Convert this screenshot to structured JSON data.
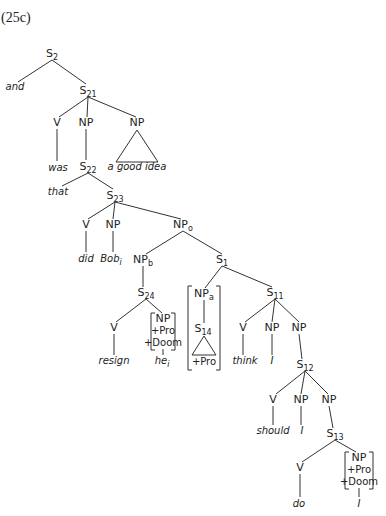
{
  "example_label": "(25c)",
  "nodes": [
    {
      "id": "S2",
      "cat": "S",
      "sub": "2",
      "x": 52,
      "y": 57,
      "type": "cat"
    },
    {
      "id": "and",
      "text": "and",
      "x": 15,
      "y": 90,
      "type": "word"
    },
    {
      "id": "S21",
      "cat": "S",
      "sub": "21",
      "x": 88,
      "y": 94,
      "type": "cat"
    },
    {
      "id": "V1",
      "cat": "V",
      "sub": "",
      "x": 57,
      "y": 126,
      "type": "cat"
    },
    {
      "id": "NP1",
      "cat": "NP",
      "sub": "",
      "x": 86,
      "y": 126,
      "type": "cat"
    },
    {
      "id": "NP2",
      "cat": "NP",
      "sub": "",
      "x": 137,
      "y": 126,
      "type": "cat"
    },
    {
      "id": "was",
      "text": "was",
      "x": 58,
      "y": 171,
      "type": "word"
    },
    {
      "id": "S22",
      "cat": "S",
      "sub": "22",
      "x": 88,
      "y": 170,
      "type": "cat"
    },
    {
      "id": "agoodidea",
      "text": "a good idea",
      "x": 137,
      "y": 170,
      "type": "word"
    },
    {
      "id": "that",
      "text": "that",
      "x": 58,
      "y": 195,
      "type": "word"
    },
    {
      "id": "S23",
      "cat": "S",
      "sub": "23",
      "x": 115,
      "y": 199,
      "type": "cat"
    },
    {
      "id": "V2",
      "cat": "V",
      "sub": "",
      "x": 86,
      "y": 228,
      "type": "cat"
    },
    {
      "id": "NP3",
      "cat": "NP",
      "sub": "",
      "x": 113,
      "y": 228,
      "type": "cat"
    },
    {
      "id": "NPo",
      "cat": "NP",
      "sub": "o",
      "x": 183,
      "y": 228,
      "type": "cat"
    },
    {
      "id": "did",
      "text": "did",
      "x": 86,
      "y": 262,
      "type": "word"
    },
    {
      "id": "Bob",
      "text": "Bob",
      "sub": "i",
      "x": 111,
      "y": 262,
      "type": "word"
    },
    {
      "id": "NPb",
      "cat": "NP",
      "sub": "b",
      "x": 143,
      "y": 263,
      "type": "cat"
    },
    {
      "id": "S1",
      "cat": "S",
      "sub": "1",
      "x": 222,
      "y": 263,
      "type": "cat"
    },
    {
      "id": "S24",
      "cat": "S",
      "sub": "24",
      "x": 146,
      "y": 296,
      "type": "cat"
    },
    {
      "id": "NPa",
      "cat": "NP",
      "sub": "a",
      "x": 204,
      "y": 297,
      "type": "cat"
    },
    {
      "id": "S11",
      "cat": "S",
      "sub": "11",
      "x": 275,
      "y": 296,
      "type": "cat"
    },
    {
      "id": "V3",
      "cat": "V",
      "sub": "",
      "x": 114,
      "y": 331,
      "type": "cat"
    },
    {
      "id": "NPpd1",
      "cat": "NP",
      "sub": "",
      "x": 163,
      "y": 322,
      "type": "cat"
    },
    {
      "id": "S14",
      "cat": "S",
      "sub": "14",
      "x": 203,
      "y": 332,
      "type": "cat"
    },
    {
      "id": "V4",
      "cat": "V",
      "sub": "",
      "x": 243,
      "y": 331,
      "type": "cat"
    },
    {
      "id": "NP5",
      "cat": "NP",
      "sub": "",
      "x": 272,
      "y": 331,
      "type": "cat"
    },
    {
      "id": "NP6",
      "cat": "NP",
      "sub": "",
      "x": 299,
      "y": 331,
      "type": "cat"
    },
    {
      "id": "resign",
      "text": "resign",
      "x": 114,
      "y": 364,
      "type": "word"
    },
    {
      "id": "he",
      "text": "he",
      "sub": "i",
      "x": 162,
      "y": 364,
      "type": "word"
    },
    {
      "id": "think",
      "text": "think",
      "x": 245,
      "y": 364,
      "type": "word"
    },
    {
      "id": "I1",
      "text": "I",
      "x": 272,
      "y": 364,
      "type": "word"
    },
    {
      "id": "S12",
      "cat": "S",
      "sub": "12",
      "x": 305,
      "y": 368,
      "type": "cat"
    },
    {
      "id": "V5",
      "cat": "V",
      "sub": "",
      "x": 273,
      "y": 403,
      "type": "cat"
    },
    {
      "id": "NP7",
      "cat": "NP",
      "sub": "",
      "x": 301,
      "y": 403,
      "type": "cat"
    },
    {
      "id": "NP8",
      "cat": "NP",
      "sub": "",
      "x": 329,
      "y": 403,
      "type": "cat"
    },
    {
      "id": "should",
      "text": "should",
      "x": 273,
      "y": 434,
      "type": "word"
    },
    {
      "id": "I2",
      "text": "I",
      "x": 302,
      "y": 434,
      "type": "word"
    },
    {
      "id": "S13",
      "cat": "S",
      "sub": "13",
      "x": 335,
      "y": 437,
      "type": "cat"
    },
    {
      "id": "V6",
      "cat": "V",
      "sub": "",
      "x": 300,
      "y": 471,
      "type": "cat"
    },
    {
      "id": "NPpd2",
      "cat": "NP",
      "sub": "",
      "x": 359,
      "y": 461,
      "type": "cat"
    },
    {
      "id": "do",
      "text": "do",
      "x": 299,
      "y": 507,
      "type": "word"
    },
    {
      "id": "I3",
      "text": "I",
      "x": 359,
      "y": 507,
      "type": "word"
    }
  ],
  "features": [
    {
      "id": "pd1_pro",
      "text": "+Pro",
      "x": 163,
      "y": 334
    },
    {
      "id": "pd1_doom",
      "text": "+Doom",
      "x": 163,
      "y": 346
    },
    {
      "id": "s14_pro",
      "text": "+Pro",
      "x": 204,
      "y": 365
    },
    {
      "id": "pd2_pro",
      "text": "+Pro",
      "x": 359,
      "y": 473
    },
    {
      "id": "pd2_doom",
      "text": "+Doom",
      "x": 359,
      "y": 485
    }
  ],
  "edges": [
    [
      52,
      60,
      18,
      82
    ],
    [
      52,
      60,
      86,
      84
    ],
    [
      88,
      97,
      59,
      117
    ],
    [
      88,
      97,
      87,
      117
    ],
    [
      88,
      97,
      136,
      117
    ],
    [
      57,
      129,
      57,
      161
    ],
    [
      86,
      129,
      86,
      160
    ],
    [
      88,
      173,
      62,
      186
    ],
    [
      88,
      173,
      113,
      189
    ],
    [
      115,
      202,
      88,
      219
    ],
    [
      115,
      202,
      113,
      219
    ],
    [
      115,
      202,
      181,
      219
    ],
    [
      86,
      231,
      86,
      252
    ],
    [
      113,
      231,
      113,
      252
    ],
    [
      183,
      231,
      146,
      254
    ],
    [
      183,
      231,
      222,
      254
    ],
    [
      143,
      266,
      143,
      287
    ],
    [
      146,
      299,
      116,
      322
    ],
    [
      146,
      299,
      162,
      313
    ],
    [
      222,
      266,
      205,
      288
    ],
    [
      222,
      266,
      272,
      287
    ],
    [
      275,
      299,
      245,
      322
    ],
    [
      275,
      299,
      272,
      322
    ],
    [
      275,
      299,
      299,
      322
    ],
    [
      114,
      334,
      114,
      355
    ],
    [
      163,
      349,
      163,
      355
    ],
    [
      204,
      300,
      204,
      323
    ],
    [
      243,
      334,
      243,
      355
    ],
    [
      272,
      334,
      272,
      355
    ],
    [
      299,
      334,
      302,
      359
    ],
    [
      305,
      371,
      276,
      394
    ],
    [
      305,
      371,
      301,
      394
    ],
    [
      305,
      371,
      328,
      394
    ],
    [
      273,
      406,
      273,
      425
    ],
    [
      301,
      406,
      301,
      425
    ],
    [
      329,
      406,
      333,
      428
    ],
    [
      335,
      440,
      302,
      462
    ],
    [
      335,
      440,
      356,
      452
    ],
    [
      300,
      474,
      300,
      497
    ],
    [
      359,
      488,
      359,
      497
    ]
  ],
  "triangles": [
    {
      "apex": [
        137,
        130
      ],
      "left": [
        116,
        162
      ],
      "right": [
        158,
        162
      ]
    },
    {
      "apex": [
        204,
        336
      ],
      "left": [
        192,
        355
      ],
      "right": [
        216,
        355
      ]
    }
  ],
  "brackets": [
    {
      "x1": 151,
      "x2": 175,
      "y1": 313,
      "y2": 350
    },
    {
      "x1": 188,
      "x2": 220,
      "y1": 286,
      "y2": 370
    },
    {
      "x1": 345,
      "x2": 373,
      "y1": 452,
      "y2": 489
    }
  ]
}
